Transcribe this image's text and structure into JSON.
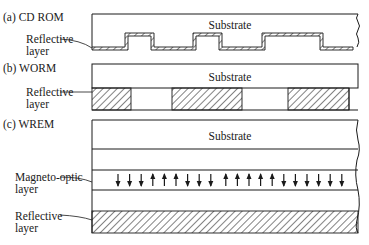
{
  "diagram": {
    "panels": [
      {
        "id": "a",
        "title": "(a) CD ROM",
        "substrate_label": "Substrate",
        "left_labels": [
          "Reflective",
          "layer"
        ]
      },
      {
        "id": "b",
        "title": "(b) WORM",
        "substrate_label": "Substrate",
        "left_labels": [
          "Reflective",
          "layer"
        ]
      },
      {
        "id": "c",
        "title": "(c) WREM",
        "substrate_label": "Substrate",
        "left_labels_mo": [
          "Magneto-optic",
          "layer"
        ],
        "left_labels_refl": [
          "Reflective",
          "layer"
        ],
        "magnetization_arrows": [
          "down",
          "down",
          "down",
          "up",
          "up",
          "up",
          "down",
          "down",
          "down",
          "up",
          "up",
          "up",
          "up",
          "up",
          "down",
          "down",
          "down",
          "down",
          "down",
          "down"
        ]
      }
    ],
    "colors": {
      "line": "#1a1a1a",
      "background": "#ffffff"
    }
  }
}
